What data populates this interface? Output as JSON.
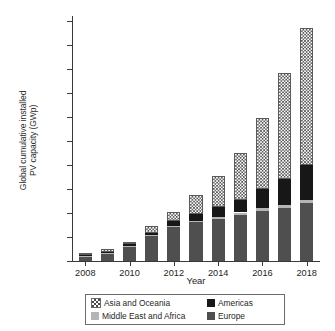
{
  "chart_data": {
    "type": "bar",
    "title": "",
    "subtitle": "",
    "stacked": true,
    "xlabel": "Year",
    "ylabel": "Global cumulative installed PV capacity (GWp)",
    "ylabel_lines": [
      "Global cumulative installed",
      "PV capacity (GWp)"
    ],
    "categories": [
      2008,
      2009,
      2010,
      2011,
      2012,
      2013,
      2014,
      2015,
      2016,
      2017,
      2018
    ],
    "xtick_labels": [
      "2008",
      "2010",
      "2012",
      "2014",
      "2016",
      "2018"
    ],
    "xtick_values": [
      2008,
      2010,
      2012,
      2014,
      2016,
      2018
    ],
    "ytick_labels": [
      "0",
      "50",
      "100",
      "150",
      "200",
      "250",
      "300",
      "350",
      "400",
      "450",
      "500"
    ],
    "ytick_values": [
      0,
      50,
      100,
      150,
      200,
      250,
      300,
      350,
      400,
      450,
      500
    ],
    "ylim": [
      0,
      510
    ],
    "xlim": [
      2007.4,
      2018.6
    ],
    "grid": false,
    "legend_position": "below-axes",
    "series": [
      {
        "name": "Europe",
        "color": "#4f4f4f",
        "pattern": "solid",
        "values": [
          11.0,
          16.5,
          30.5,
          52.5,
          70.5,
          81.0,
          88.0,
          96.0,
          104.0,
          111.0,
          120.0
        ]
      },
      {
        "name": "Middle East and Africa",
        "color": "#b5b5b5",
        "pattern": "solid",
        "values": [
          0.4,
          0.7,
          1.2,
          1.8,
          2.5,
          3.2,
          4.0,
          5.0,
          5.6,
          6.2,
          7.0
        ]
      },
      {
        "name": "Americas",
        "color": "#171717",
        "pattern": "solid",
        "values": [
          1.2,
          1.8,
          3.0,
          5.0,
          9.5,
          14.0,
          20.0,
          27.0,
          41.0,
          54.0,
          72.0
        ]
      },
      {
        "name": "Asia and Oceania",
        "color": "#4a4a4a",
        "pattern": "checkerboard",
        "values": [
          3.4,
          5.0,
          5.3,
          12.7,
          20.5,
          38.8,
          64.0,
          97.0,
          148.0,
          221.0,
          287.0
        ]
      }
    ],
    "totals": [
      16,
      24,
      40,
      72,
      103,
      137,
      176,
      225,
      298,
      392,
      486
    ],
    "stack_order_bottom_to_top": [
      "Europe",
      "Middle East and Africa",
      "Americas",
      "Asia and Oceania"
    ],
    "legend_entries": [
      {
        "label": "Asia and Oceania",
        "swatch": "checkerboard"
      },
      {
        "label": "Americas",
        "swatch": "black"
      },
      {
        "label": "Middle East and Africa",
        "swatch": "light-gray"
      },
      {
        "label": "Europe",
        "swatch": "dark-gray"
      }
    ]
  }
}
